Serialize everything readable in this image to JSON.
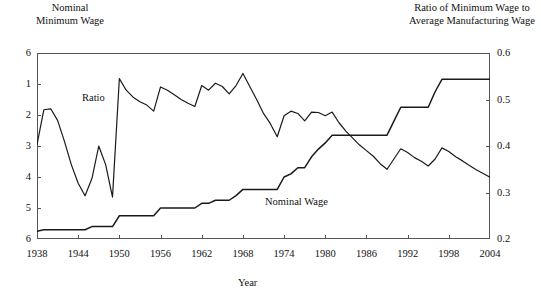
{
  "figure": {
    "left_axis_caption": "Nominal\nMinimum Wage",
    "right_axis_caption": "Ratio of Minimum Wage to\nAverage Manufacturing Wage",
    "xaxis_title": "Year",
    "series_labels": {
      "ratio": "Ratio",
      "nominal": "Nominal Wage"
    },
    "line_color": "#1a1a1a",
    "axis_color": "#555555",
    "background": "#ffffff"
  },
  "chart_data": {
    "type": "line",
    "title": "",
    "subtitle": "",
    "xlabel": "Year",
    "ylabel": "Nominal Minimum Wage",
    "y2label": "Ratio of Minimum Wage to Average Manufacturing Wage",
    "grid": false,
    "legend": "inline-annotations",
    "xlim": [
      1938,
      2004
    ],
    "xticks": [
      1938,
      1944,
      1950,
      1956,
      1962,
      1968,
      1974,
      1980,
      1986,
      1992,
      1998,
      2004
    ],
    "xtick_labels": [
      "1938",
      "1944",
      "1950",
      "1956",
      "1962",
      "1968",
      "1974",
      "1980",
      "1986",
      "1992",
      "1998",
      "2004"
    ],
    "ylim": [
      0,
      6
    ],
    "yticks": [
      0,
      1,
      2,
      3,
      4,
      5,
      6
    ],
    "ytick_labels": [
      "6",
      "5",
      "4",
      "3",
      "2",
      "1",
      "6"
    ],
    "y2lim": [
      0.2,
      0.6
    ],
    "y2ticks": [
      0.2,
      0.3,
      0.4,
      0.5,
      0.6
    ],
    "y2tick_labels": [
      "0.2",
      "0.3",
      "0.4",
      "0.5",
      "0.6"
    ],
    "x": [
      1938,
      1939,
      1940,
      1941,
      1942,
      1943,
      1944,
      1945,
      1946,
      1947,
      1948,
      1949,
      1950,
      1951,
      1952,
      1953,
      1954,
      1955,
      1956,
      1957,
      1958,
      1959,
      1960,
      1961,
      1962,
      1963,
      1964,
      1965,
      1966,
      1967,
      1968,
      1969,
      1970,
      1971,
      1972,
      1973,
      1974,
      1975,
      1976,
      1977,
      1978,
      1979,
      1980,
      1981,
      1982,
      1983,
      1984,
      1985,
      1986,
      1987,
      1988,
      1989,
      1990,
      1991,
      1992,
      1993,
      1994,
      1995,
      1996,
      1997,
      1998,
      1999,
      2000,
      2001,
      2002,
      2003,
      2004
    ],
    "series": [
      {
        "name": "Nominal Wage",
        "axis": "left",
        "label_text": "Nominal Wage",
        "units": "dollars per hour",
        "values": [
          0.25,
          0.3,
          0.3,
          0.3,
          0.3,
          0.3,
          0.3,
          0.3,
          0.4,
          0.4,
          0.4,
          0.4,
          0.75,
          0.75,
          0.75,
          0.75,
          0.75,
          0.75,
          1.0,
          1.0,
          1.0,
          1.0,
          1.0,
          1.0,
          1.15,
          1.15,
          1.25,
          1.25,
          1.25,
          1.4,
          1.6,
          1.6,
          1.6,
          1.6,
          1.6,
          1.6,
          2.0,
          2.1,
          2.3,
          2.3,
          2.65,
          2.9,
          3.1,
          3.35,
          3.35,
          3.35,
          3.35,
          3.35,
          3.35,
          3.35,
          3.35,
          3.35,
          3.8,
          4.25,
          4.25,
          4.25,
          4.25,
          4.25,
          4.75,
          5.15,
          5.15,
          5.15,
          5.15,
          5.15,
          5.15,
          5.15,
          5.15
        ]
      },
      {
        "name": "Ratio",
        "axis": "right",
        "label_text": "Ratio",
        "units": "ratio",
        "values": [
          0.403,
          0.478,
          0.48,
          0.455,
          0.41,
          0.36,
          0.32,
          0.293,
          0.33,
          0.4,
          0.36,
          0.29,
          0.545,
          0.52,
          0.505,
          0.495,
          0.488,
          0.475,
          0.527,
          0.52,
          0.51,
          0.5,
          0.492,
          0.485,
          0.53,
          0.52,
          0.535,
          0.528,
          0.512,
          0.53,
          0.556,
          0.528,
          0.5,
          0.47,
          0.448,
          0.42,
          0.465,
          0.475,
          0.47,
          0.454,
          0.473,
          0.472,
          0.465,
          0.473,
          0.45,
          0.432,
          0.417,
          0.402,
          0.39,
          0.378,
          0.362,
          0.35,
          0.372,
          0.394,
          0.386,
          0.375,
          0.367,
          0.357,
          0.372,
          0.396,
          0.388,
          0.377,
          0.368,
          0.358,
          0.349,
          0.341,
          0.333
        ]
      }
    ],
    "annotations": [
      {
        "text": "Ratio",
        "x": 1945.5,
        "y2": 0.512
      },
      {
        "text": "Nominal Wage",
        "x": 1977,
        "y": 1.45
      }
    ]
  }
}
